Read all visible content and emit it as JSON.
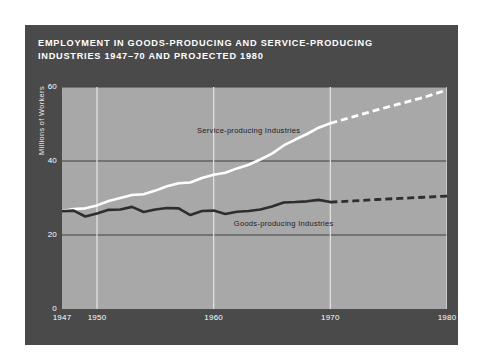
{
  "figure": {
    "title_lines": [
      "EMPLOYMENT IN GOODS-PRODUCING AND SERVICE-PRODUCING",
      "INDUSTRIES 1947–70 AND PROJECTED 1980"
    ],
    "card_color": "#4a4a4a",
    "plot_color": "#a8a8a8",
    "page_color": "#ffffff"
  },
  "chart_data": {
    "type": "line",
    "xlabel": "",
    "ylabel": "Millions of Workers",
    "xlim": [
      1947,
      1980
    ],
    "ylim": [
      0,
      60
    ],
    "yticks": [
      0,
      20,
      40,
      60
    ],
    "xticks": [
      1947,
      1950,
      1960,
      1970,
      1980
    ],
    "grid": "horizontal-and-vertical",
    "legend": "inline-annotations",
    "projection_start": 1970,
    "series": [
      {
        "name": "Service-producing Industries",
        "color": "#ffffff",
        "label_x": 1963,
        "label_y": 47.5,
        "x": [
          1947,
          1948,
          1949,
          1950,
          1951,
          1952,
          1953,
          1954,
          1955,
          1956,
          1957,
          1958,
          1959,
          1960,
          1961,
          1962,
          1963,
          1964,
          1965,
          1966,
          1967,
          1968,
          1969,
          1970,
          1972,
          1974,
          1976,
          1978,
          1980
        ],
        "values": [
          26.5,
          27.0,
          27.2,
          28.0,
          29.2,
          30.0,
          30.8,
          31.0,
          32.0,
          33.2,
          34.0,
          34.2,
          35.4,
          36.3,
          36.8,
          38.0,
          39.0,
          40.4,
          42.0,
          44.2,
          45.8,
          47.3,
          49.0,
          50.2,
          52.0,
          53.8,
          55.5,
          57.2,
          59.2
        ],
        "style_solid_through": 1970
      },
      {
        "name": "Goods-producing Industries",
        "color": "#2e2e2e",
        "label_x": 1966,
        "label_y": 22.5,
        "x": [
          1947,
          1948,
          1949,
          1950,
          1951,
          1952,
          1953,
          1954,
          1955,
          1956,
          1957,
          1958,
          1959,
          1960,
          1961,
          1962,
          1963,
          1964,
          1965,
          1966,
          1967,
          1968,
          1969,
          1970,
          1972,
          1974,
          1976,
          1978,
          1980
        ],
        "values": [
          26.4,
          26.6,
          25.0,
          25.8,
          26.8,
          26.9,
          27.6,
          26.2,
          26.9,
          27.3,
          27.2,
          25.4,
          26.5,
          26.6,
          25.7,
          26.3,
          26.5,
          26.9,
          27.7,
          28.8,
          28.9,
          29.1,
          29.5,
          28.9,
          29.2,
          29.6,
          29.9,
          30.2,
          30.5
        ],
        "style_solid_through": 1970
      }
    ]
  }
}
